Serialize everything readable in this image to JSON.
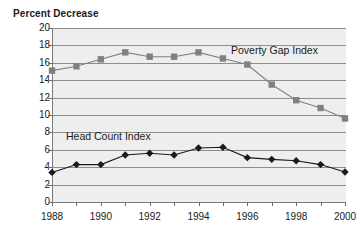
{
  "chart_data": {
    "type": "line",
    "title": "",
    "ylabel": "Percent Decrease",
    "xlabel": "",
    "ylim": [
      0,
      20
    ],
    "ytick_step": 2,
    "yticks": [
      20,
      18,
      16,
      14,
      12,
      10,
      8,
      6,
      4,
      2,
      0
    ],
    "grid": true,
    "legend_position": "inline-annotation",
    "x": [
      1988,
      1989,
      1990,
      1991,
      1992,
      1993,
      1994,
      1995,
      1996,
      1997,
      1998,
      1999,
      2000
    ],
    "xtick_labels": [
      "1988",
      "1990",
      "1992",
      "1994",
      "1996",
      "1998",
      "2000"
    ],
    "xtick_values": [
      1988,
      1990,
      1992,
      1994,
      1996,
      1998,
      2000
    ],
    "series": [
      {
        "name": "Poverty Gap Index",
        "marker": "square",
        "color": "#808080",
        "values": [
          15.1,
          15.6,
          16.4,
          17.2,
          16.7,
          16.7,
          17.2,
          16.5,
          15.8,
          13.5,
          11.7,
          10.8,
          9.6
        ]
      },
      {
        "name": "Head Count Index",
        "marker": "diamond",
        "color": "#1a1a1a",
        "values": [
          3.4,
          4.3,
          4.3,
          5.4,
          5.6,
          5.4,
          6.2,
          6.3,
          5.1,
          4.9,
          4.75,
          4.3,
          3.45
        ]
      }
    ],
    "annotations": [
      {
        "text": "Poverty Gap Index",
        "series": "Poverty Gap Index"
      },
      {
        "text": "Head Count Index",
        "series": "Head Count Index"
      }
    ],
    "colors": {
      "plot_background": "#eeeeee",
      "gridline": "#8d8d8d",
      "axis": "#7a7a7a",
      "text": "#1a1a1a"
    }
  }
}
